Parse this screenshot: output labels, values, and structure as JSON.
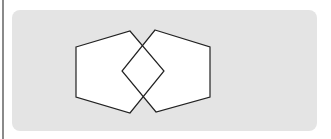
{
  "figure": {
    "colors": {
      "panel": "#e4e4e4",
      "shape_fill": "#ffffff",
      "stroke": "#222222",
      "left_rule": "#8a8a8a"
    },
    "shapes": [
      {
        "name": "left-pentagon",
        "points": "76,47 130,31 164,71 130,113 76,97"
      },
      {
        "name": "right-pentagon",
        "points": "155,30 210,47 210,97 156,112 122,71"
      }
    ]
  }
}
